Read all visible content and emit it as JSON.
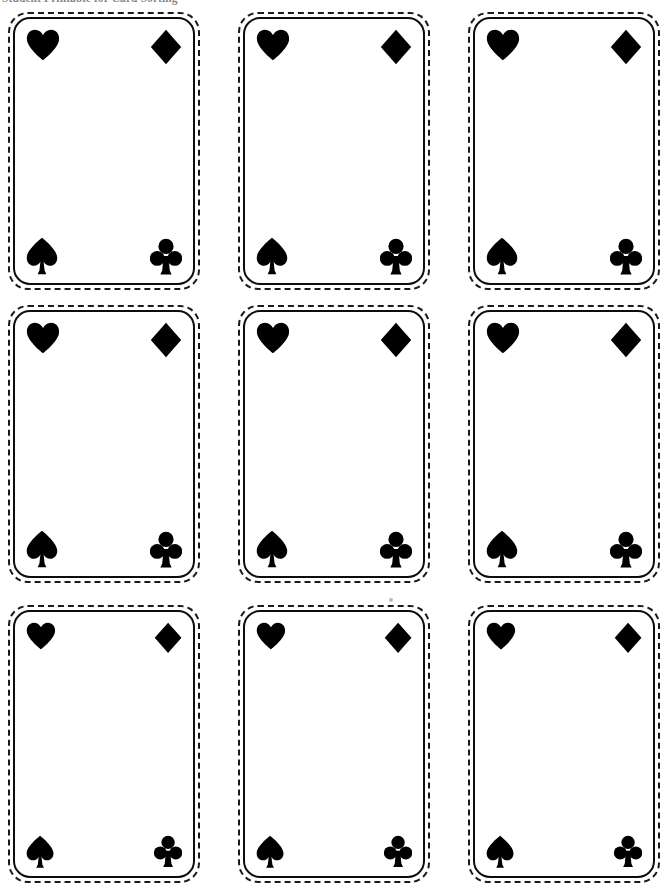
{
  "page": {
    "width": 668,
    "height": 892,
    "background_color": "#ffffff",
    "ink_color": "#000000",
    "document_type": "printable-card-template-sheet"
  },
  "header": {
    "title": "Student Printable for Card Sorting",
    "clipped": true,
    "color": "#5a5a5a"
  },
  "grid": {
    "rows": 3,
    "columns": 3,
    "total_cards": 9,
    "column_left_positions": [
      8,
      238,
      468
    ],
    "row_top_positions": [
      12,
      305,
      605
    ],
    "card_width": 192,
    "card_height": 278
  },
  "card_style": {
    "cutline_style": "dashed",
    "cutline_color": "#1a1a1a",
    "face_border_style": "solid",
    "face_border_color": "#0d0d0d",
    "corner_radius_label": "rounded",
    "face_fill": "#ffffff"
  },
  "suit_layout": {
    "top_left": "heart-suit-icon",
    "top_right": "diamond-suit-icon",
    "bottom_left": "spade-suit-icon",
    "bottom_right": "club-suit-icon"
  },
  "cards": [
    {
      "index": 1,
      "row": 1,
      "column": 1,
      "left": 8,
      "top": 12,
      "width": 192,
      "height": 278,
      "suit_scale": 1.0,
      "label": "card-r1c1"
    },
    {
      "index": 2,
      "row": 1,
      "column": 2,
      "left": 238,
      "top": 12,
      "width": 192,
      "height": 278,
      "suit_scale": 1.0,
      "label": "card-r1c2"
    },
    {
      "index": 3,
      "row": 1,
      "column": 3,
      "left": 468,
      "top": 12,
      "width": 192,
      "height": 278,
      "suit_scale": 1.0,
      "label": "card-r1c3"
    },
    {
      "index": 4,
      "row": 2,
      "column": 1,
      "left": 8,
      "top": 305,
      "width": 192,
      "height": 278,
      "suit_scale": 1.0,
      "label": "card-r2c1"
    },
    {
      "index": 5,
      "row": 2,
      "column": 2,
      "left": 238,
      "top": 305,
      "width": 192,
      "height": 278,
      "suit_scale": 1.0,
      "label": "card-r2c2"
    },
    {
      "index": 6,
      "row": 2,
      "column": 3,
      "left": 468,
      "top": 305,
      "width": 192,
      "height": 278,
      "suit_scale": 1.0,
      "label": "card-r2c3"
    },
    {
      "index": 7,
      "row": 3,
      "column": 1,
      "left": 8,
      "top": 605,
      "width": 192,
      "height": 278,
      "suit_scale": 0.88,
      "label": "card-r3c1"
    },
    {
      "index": 8,
      "row": 3,
      "column": 2,
      "left": 238,
      "top": 605,
      "width": 192,
      "height": 278,
      "suit_scale": 0.88,
      "label": "card-r3c2"
    },
    {
      "index": 9,
      "row": 3,
      "column": 3,
      "left": 468,
      "top": 605,
      "width": 192,
      "height": 278,
      "suit_scale": 0.88,
      "label": "card-r3c3"
    }
  ],
  "artifacts": [
    {
      "name": "scan-speck",
      "left": 389,
      "top": 598,
      "size": 4
    }
  ]
}
